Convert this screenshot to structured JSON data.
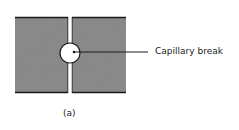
{
  "diagram": {
    "callout_label": "Capillary break",
    "caption": "(a)",
    "colors": {
      "block_fill": "#8f8f8f",
      "outline": "#1a1a1a",
      "gap": "#ffffff"
    }
  }
}
